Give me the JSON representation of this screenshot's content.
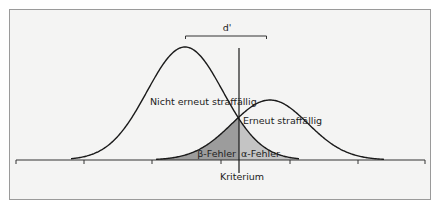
{
  "diagram": {
    "type": "signal-detection",
    "labels": {
      "d_prime": "d'",
      "left_distribution": "Nicht erneut straffällig",
      "right_distribution": "Erneut straffällig",
      "beta_error": "β-Fehler",
      "alpha_error": "α-Fehler",
      "criterion": "Kriterium"
    },
    "colors": {
      "background": "#f4f4f3",
      "frame_border": "#9a9a9a",
      "curve": "#1a1a1a",
      "beta_fill": "#9c9c9c",
      "alpha_fill": "#c4c4c4"
    },
    "distributions": [
      {
        "name": "Nicht erneut straffällig",
        "peak_x": 185,
        "peak_y": 47,
        "sigma": 38
      },
      {
        "name": "Erneut straffällig",
        "peak_x": 270,
        "peak_y": 100,
        "sigma": 38
      }
    ],
    "criterion_x": 239,
    "baseline_y": 160,
    "ticks_x": [
      16,
      84,
      152,
      221,
      290,
      358,
      425
    ]
  }
}
